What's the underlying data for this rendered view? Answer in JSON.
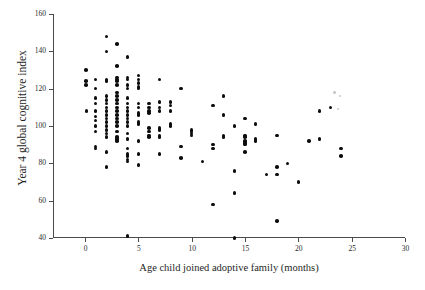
{
  "figure": {
    "title_faint": "",
    "background": "#ffffff",
    "point_color": "#0d0d0d",
    "axis_color": "#4a4a4a"
  },
  "chart_data": {
    "type": "scatter",
    "title": "",
    "xlabel": "Age child joined adoptive family (months)",
    "ylabel": "Year 4 global cognitive index",
    "xlim": [
      -3,
      30
    ],
    "ylim": [
      40,
      160
    ],
    "xticks": [
      0,
      5,
      10,
      15,
      20,
      25,
      30
    ],
    "yticks": [
      40,
      60,
      80,
      100,
      120,
      140,
      160
    ],
    "grid": false,
    "legend": null,
    "marker": "filled-circle",
    "points": [
      [
        0.1,
        130
      ],
      [
        0.1,
        124
      ],
      [
        0.1,
        122
      ],
      [
        0.15,
        108
      ],
      [
        1.0,
        125
      ],
      [
        1.0,
        120
      ],
      [
        1.0,
        115
      ],
      [
        1.0,
        112
      ],
      [
        1.0,
        108
      ],
      [
        1.0,
        105
      ],
      [
        1.0,
        103
      ],
      [
        1.0,
        100
      ],
      [
        1.0,
        97
      ],
      [
        1.0,
        89
      ],
      [
        1.0,
        88
      ],
      [
        2.0,
        148
      ],
      [
        2.0,
        140
      ],
      [
        2.0,
        125
      ],
      [
        2.0,
        124
      ],
      [
        2.0,
        116
      ],
      [
        2.0,
        114
      ],
      [
        2.0,
        112
      ],
      [
        2.0,
        110
      ],
      [
        2.0,
        108
      ],
      [
        2.0,
        106
      ],
      [
        2.0,
        104
      ],
      [
        2.0,
        102
      ],
      [
        2.0,
        100
      ],
      [
        2.0,
        98
      ],
      [
        2.0,
        96
      ],
      [
        2.0,
        94
      ],
      [
        2.0,
        86
      ],
      [
        2.0,
        78
      ],
      [
        3.0,
        144
      ],
      [
        3.0,
        132
      ],
      [
        3.0,
        126
      ],
      [
        3.0,
        125
      ],
      [
        3.0,
        124
      ],
      [
        3.0,
        122
      ],
      [
        3.0,
        118
      ],
      [
        3.0,
        116
      ],
      [
        3.0,
        114
      ],
      [
        3.0,
        112
      ],
      [
        3.0,
        110
      ],
      [
        3.0,
        108
      ],
      [
        3.0,
        106
      ],
      [
        3.0,
        104
      ],
      [
        3.0,
        102
      ],
      [
        3.0,
        100
      ],
      [
        3.0,
        97
      ],
      [
        3.0,
        94
      ],
      [
        3.0,
        93
      ],
      [
        3.0,
        92
      ],
      [
        4.0,
        137
      ],
      [
        4.0,
        126
      ],
      [
        4.0,
        125
      ],
      [
        4.0,
        122
      ],
      [
        4.0,
        120
      ],
      [
        4.0,
        115
      ],
      [
        4.0,
        112
      ],
      [
        4.0,
        110
      ],
      [
        4.0,
        108
      ],
      [
        4.0,
        106
      ],
      [
        4.0,
        104
      ],
      [
        4.0,
        102
      ],
      [
        4.0,
        100
      ],
      [
        4.0,
        96
      ],
      [
        4.0,
        93
      ],
      [
        4.0,
        88
      ],
      [
        4.0,
        85
      ],
      [
        4.0,
        84
      ],
      [
        4.0,
        82
      ],
      [
        4.0,
        81
      ],
      [
        4.0,
        41
      ],
      [
        5.0,
        127
      ],
      [
        5.0,
        125
      ],
      [
        5.0,
        123
      ],
      [
        5.0,
        121
      ],
      [
        5.0,
        120
      ],
      [
        5.0,
        112
      ],
      [
        5.0,
        110
      ],
      [
        5.0,
        107
      ],
      [
        5.0,
        106
      ],
      [
        5.0,
        102
      ],
      [
        5.0,
        101
      ],
      [
        5.0,
        92
      ],
      [
        5.0,
        85
      ],
      [
        5.0,
        79
      ],
      [
        6.0,
        112
      ],
      [
        6.0,
        110
      ],
      [
        6.0,
        108
      ],
      [
        6.0,
        107
      ],
      [
        6.0,
        99
      ],
      [
        6.0,
        97
      ],
      [
        6.0,
        95
      ],
      [
        6.0,
        94
      ],
      [
        7.0,
        125
      ],
      [
        7.0,
        113
      ],
      [
        7.0,
        110
      ],
      [
        7.0,
        108
      ],
      [
        7.0,
        99
      ],
      [
        7.0,
        98
      ],
      [
        7.0,
        95
      ],
      [
        7.0,
        94
      ],
      [
        7.0,
        85
      ],
      [
        8.0,
        113
      ],
      [
        8.0,
        111
      ],
      [
        8.0,
        108
      ],
      [
        8.0,
        101
      ],
      [
        8.0,
        100
      ],
      [
        9.0,
        120
      ],
      [
        9.0,
        89
      ],
      [
        9.0,
        83
      ],
      [
        10.0,
        98
      ],
      [
        10.0,
        97
      ],
      [
        10.0,
        96
      ],
      [
        10.0,
        95
      ],
      [
        11.0,
        81
      ],
      [
        12.0,
        111
      ],
      [
        12.0,
        90
      ],
      [
        12.0,
        88
      ],
      [
        12.0,
        58
      ],
      [
        13.0,
        116
      ],
      [
        13.0,
        106
      ],
      [
        13.0,
        95
      ],
      [
        13.0,
        94
      ],
      [
        14.0,
        100
      ],
      [
        14.0,
        76
      ],
      [
        14.0,
        64
      ],
      [
        14.0,
        40
      ],
      [
        15.0,
        104
      ],
      [
        15.0,
        95
      ],
      [
        15.0,
        94
      ],
      [
        15.0,
        92
      ],
      [
        15.0,
        91
      ],
      [
        15.0,
        90
      ],
      [
        15.0,
        86
      ],
      [
        16.0,
        101
      ],
      [
        16.0,
        93
      ],
      [
        16.0,
        92
      ],
      [
        17.0,
        74
      ],
      [
        18.0,
        95
      ],
      [
        18.0,
        78
      ],
      [
        18.0,
        74
      ],
      [
        18.0,
        49
      ],
      [
        19.0,
        80
      ],
      [
        20.0,
        70
      ],
      [
        21.0,
        92
      ],
      [
        22.0,
        108
      ],
      [
        22.0,
        93
      ],
      [
        23.0,
        110
      ],
      [
        24.0,
        88
      ],
      [
        24.0,
        84
      ]
    ],
    "faint_points": [
      [
        23.4,
        118
      ],
      [
        23.9,
        116
      ],
      [
        23.7,
        109
      ]
    ]
  }
}
